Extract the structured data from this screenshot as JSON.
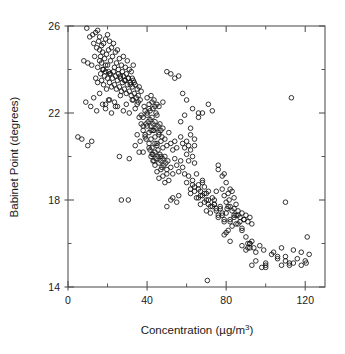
{
  "chart_data": {
    "type": "scatter",
    "title": "",
    "xlabel": "Concentration (µg/m3)",
    "xlabel_base": "Concentration (µg/m",
    "xlabel_sup": "3",
    "xlabel_close": ")",
    "ylabel": "Babinet Point (degrees)",
    "xlim": [
      0,
      130
    ],
    "ylim": [
      14,
      26
    ],
    "xticks": [
      0,
      20,
      40,
      60,
      80,
      100,
      120
    ],
    "xtick_labels": [
      "0",
      "",
      "40",
      "",
      "80",
      "",
      "120"
    ],
    "yticks": [
      14,
      16,
      18,
      20,
      22,
      24,
      26
    ],
    "ytick_labels": [
      "14",
      "",
      "18",
      "",
      "22",
      "",
      "26"
    ],
    "grid": false,
    "legend": false,
    "marker": "open-circle",
    "marker_size_px": 4.6,
    "marker_color": "#111111",
    "frame_color": "#555555",
    "n_points": 392,
    "x": [
      9.5,
      11.0,
      12.5,
      13.0,
      14.0,
      14.5,
      15.0,
      15.5,
      16.0,
      16.0,
      16.5,
      17.0,
      17.0,
      17.5,
      18.0,
      18.0,
      18.5,
      19.0,
      19.0,
      19.5,
      20.0,
      20.0,
      20.5,
      21.0,
      21.0,
      21.5,
      22.0,
      22.5,
      23.0,
      23.5,
      24.0,
      24.5,
      25.0,
      25.5,
      26.0,
      26.5,
      27.0,
      27.5,
      28.0,
      28.5,
      29.0,
      29.5,
      30.0,
      30.5,
      31.0,
      31.5,
      32.0,
      32.5,
      33.0,
      33.5,
      8.0,
      10.0,
      12.0,
      13.5,
      14.0,
      15.0,
      15.0,
      16.0,
      16.5,
      17.0,
      17.5,
      18.0,
      18.5,
      19.0,
      19.5,
      20.0,
      20.5,
      21.0,
      21.5,
      22.0,
      22.5,
      23.0,
      23.5,
      24.0,
      24.5,
      25.0,
      25.5,
      26.0,
      26.5,
      27.0,
      27.5,
      28.0,
      28.5,
      29.0,
      29.5,
      30.0,
      30.5,
      31.0,
      31.5,
      32.0,
      32.5,
      33.0,
      33.5,
      34.0,
      34.5,
      35.0,
      35.5,
      36.0,
      36.5,
      37.0,
      9.0,
      11.5,
      13.0,
      14.5,
      16.0,
      17.5,
      19.0,
      20.5,
      22.0,
      23.5,
      25.0,
      26.5,
      28.0,
      29.5,
      31.0,
      32.5,
      34.0,
      35.5,
      37.0,
      38.5,
      40.0,
      41.0,
      41.5,
      42.0,
      42.5,
      43.0,
      43.5,
      44.0,
      44.5,
      45.0,
      38.0,
      39.0,
      39.5,
      40.0,
      40.5,
      41.0,
      41.5,
      42.0,
      42.5,
      43.0,
      43.5,
      44.0,
      44.5,
      45.0,
      45.5,
      46.0,
      46.5,
      47.0,
      47.5,
      48.0,
      36.0,
      37.0,
      38.0,
      39.0,
      40.0,
      41.0,
      42.0,
      43.0,
      44.0,
      45.0,
      46.0,
      47.0,
      48.0,
      49.0,
      50.0,
      51.0,
      52.0,
      53.0,
      54.0,
      55.0,
      34.0,
      35.0,
      36.5,
      38.0,
      39.5,
      41.0,
      42.5,
      44.0,
      45.5,
      47.0,
      41.0,
      41.5,
      42.0,
      42.5,
      43.0,
      43.5,
      44.0,
      44.5,
      45.0,
      45.5,
      46.0,
      46.5,
      47.0,
      47.5,
      48.0,
      48.5,
      49.0,
      49.5,
      50.0,
      50.5,
      5.0,
      7.0,
      10.0,
      12.0,
      19.0,
      21.0,
      24.0,
      26.0,
      27.0,
      30.5,
      31.0,
      33.0,
      35.0,
      36.0,
      38.0,
      39.0,
      40.0,
      42.0,
      43.0,
      44.0,
      45.0,
      46.0,
      47.0,
      48.0,
      49.0,
      50.0,
      51.0,
      52.0,
      53.0,
      54.0,
      46.0,
      48.0,
      50.0,
      52.0,
      54.0,
      56.0,
      58.0,
      60.0,
      62.0,
      64.0,
      50.0,
      52.0,
      53.0,
      55.0,
      56.0,
      57.0,
      58.0,
      59.0,
      60.0,
      61.0,
      55.0,
      56.0,
      57.0,
      58.0,
      59.0,
      60.0,
      61.0,
      62.0,
      63.0,
      64.0,
      60.0,
      61.0,
      62.0,
      63.0,
      64.0,
      65.0,
      66.0,
      67.0,
      68.0,
      69.0,
      62.0,
      63.0,
      64.0,
      65.0,
      66.0,
      67.0,
      68.0,
      69.0,
      70.0,
      71.0,
      66.0,
      67.0,
      68.0,
      69.0,
      70.0,
      71.0,
      72.0,
      73.0,
      74.0,
      75.0,
      70.0,
      71.0,
      72.0,
      73.0,
      74.0,
      75.0,
      76.0,
      77.0,
      78.0,
      79.0,
      74.0,
      75.0,
      76.0,
      77.0,
      78.0,
      79.0,
      80.0,
      81.0,
      82.0,
      83.0,
      78.0,
      79.0,
      80.0,
      80.5,
      81.0,
      81.5,
      82.0,
      83.0,
      84.0,
      85.0,
      80.0,
      81.0,
      82.0,
      83.0,
      84.0,
      85.0,
      86.0,
      87.0,
      88.0,
      89.0,
      84.0,
      85.0,
      86.0,
      87.0,
      88.0,
      89.0,
      90.0,
      91.0,
      92.0,
      93.0,
      57.0,
      59.0,
      62.0,
      64.0,
      66.0,
      68.0,
      71.0,
      73.0,
      76.0,
      79.0,
      76.0,
      78.0,
      80.0,
      82.0,
      84.0,
      86.0,
      88.0,
      90.0,
      92.0,
      94.0,
      88.0,
      90.0,
      91.0,
      92.0,
      93.0,
      95.0,
      97.0,
      99.0,
      100.0,
      103.0,
      93.0,
      95.0,
      98.0,
      100.0,
      104.0,
      106.0,
      108.0,
      110.0,
      112.0,
      114.0,
      106.0,
      108.0,
      110.0,
      112.0,
      114.0,
      116.0,
      118.0,
      120.0,
      120.5,
      122.0,
      110.0,
      113.0,
      70.5,
      79.0,
      82.0,
      91.0,
      92.0,
      100.0,
      118.0,
      121.0,
      63.0,
      66.0
    ],
    "y": [
      25.9,
      25.5,
      25.6,
      25.2,
      25.7,
      25.0,
      25.8,
      25.3,
      24.9,
      25.5,
      24.6,
      25.1,
      24.3,
      24.8,
      25.2,
      24.0,
      24.5,
      25.4,
      23.9,
      24.7,
      25.6,
      24.2,
      24.9,
      25.3,
      23.8,
      24.4,
      25.0,
      24.6,
      25.2,
      24.1,
      24.8,
      24.3,
      24.9,
      24.0,
      24.5,
      23.7,
      24.2,
      23.9,
      24.6,
      23.5,
      24.1,
      23.8,
      24.4,
      23.6,
      24.0,
      23.3,
      23.9,
      23.6,
      24.2,
      23.4,
      24.4,
      24.3,
      24.2,
      24.6,
      23.6,
      24.1,
      23.4,
      24.4,
      23.8,
      23.5,
      24.0,
      23.3,
      23.7,
      24.2,
      23.1,
      23.6,
      23.9,
      23.4,
      23.8,
      23.2,
      23.6,
      23.9,
      23.3,
      23.7,
      23.1,
      23.5,
      23.8,
      23.2,
      23.6,
      23.0,
      23.4,
      23.7,
      23.1,
      23.5,
      22.9,
      23.3,
      23.6,
      23.0,
      23.4,
      22.8,
      23.2,
      23.5,
      22.9,
      23.3,
      22.7,
      23.1,
      22.8,
      23.2,
      22.6,
      23.0,
      22.5,
      22.3,
      22.7,
      22.1,
      22.9,
      22.4,
      22.2,
      22.6,
      22.0,
      22.5,
      22.3,
      22.8,
      22.1,
      22.4,
      22.0,
      22.6,
      22.2,
      22.5,
      21.9,
      22.3,
      22.7,
      22.4,
      22.1,
      22.8,
      22.5,
      22.2,
      22.6,
      22.3,
      22.0,
      22.4,
      21.8,
      22.1,
      21.5,
      21.9,
      21.6,
      22.2,
      21.7,
      21.4,
      21.8,
      21.5,
      21.2,
      21.6,
      21.3,
      21.9,
      21.4,
      21.1,
      21.5,
      21.2,
      20.9,
      21.3,
      21.8,
      21.5,
      21.2,
      20.9,
      21.4,
      21.1,
      20.8,
      21.2,
      20.9,
      20.6,
      21.0,
      20.7,
      20.4,
      20.8,
      20.5,
      21.1,
      20.6,
      20.3,
      20.7,
      20.4,
      20.5,
      21.0,
      20.7,
      20.2,
      20.8,
      20.4,
      20.1,
      20.6,
      20.3,
      20.0,
      20.6,
      20.3,
      20.0,
      20.4,
      20.1,
      19.8,
      20.2,
      19.9,
      20.5,
      20.0,
      19.7,
      20.1,
      19.8,
      19.5,
      19.9,
      19.6,
      20.0,
      19.7,
      19.4,
      19.8,
      20.9,
      20.8,
      20.5,
      20.7,
      22.4,
      22.6,
      22.3,
      20.0,
      18.0,
      18.0,
      19.9,
      22.6,
      22.4,
      20.2,
      21.4,
      21.0,
      22.0,
      21.2,
      19.8,
      19.6,
      19.3,
      19.0,
      19.4,
      19.1,
      18.8,
      19.2,
      18.9,
      19.5,
      19.2,
      19.9,
      22.3,
      22.5,
      23.9,
      23.8,
      23.6,
      23.7,
      22.9,
      22.6,
      21.0,
      20.8,
      17.7,
      18.0,
      18.1,
      17.9,
      18.2,
      20.9,
      20.6,
      20.4,
      20.7,
      20.5,
      19.6,
      19.3,
      19.8,
      19.5,
      19.2,
      20.1,
      19.8,
      20.3,
      20.0,
      19.7,
      18.8,
      19.1,
      18.5,
      18.9,
      18.6,
      19.2,
      18.7,
      18.4,
      18.9,
      18.6,
      18.3,
      18.7,
      18.4,
      18.1,
      18.5,
      18.2,
      18.8,
      18.3,
      18.0,
      18.4,
      18.1,
      17.8,
      18.2,
      17.9,
      18.3,
      18.0,
      17.7,
      18.1,
      17.8,
      18.4,
      17.5,
      17.8,
      17.4,
      17.7,
      18.0,
      17.6,
      17.3,
      17.7,
      17.4,
      17.1,
      17.8,
      17.5,
      17.2,
      17.6,
      17.3,
      17.0,
      17.4,
      17.7,
      17.1,
      17.5,
      18.5,
      18.2,
      17.9,
      17.6,
      18.3,
      18.0,
      17.7,
      18.4,
      18.1,
      17.8,
      16.5,
      16.6,
      17.0,
      16.8,
      17.2,
      16.9,
      17.3,
      17.0,
      16.7,
      17.1,
      17.6,
      17.3,
      17.5,
      17.2,
      17.4,
      17.1,
      17.3,
      17.0,
      17.2,
      16.9,
      21.6,
      21.9,
      21.3,
      20.5,
      21.8,
      22.0,
      22.4,
      22.1,
      19.6,
      19.2,
      19.4,
      19.1,
      18.8,
      18.5,
      17.3,
      16.9,
      16.6,
      16.3,
      16.0,
      15.8,
      15.9,
      15.7,
      16.0,
      15.8,
      16.1,
      15.6,
      15.9,
      15.7,
      15.1,
      15.5,
      15.0,
      15.2,
      14.9,
      15.0,
      15.6,
      15.4,
      15.8,
      15.2,
      15.0,
      15.1,
      15.3,
      15.0,
      15.4,
      15.1,
      15.7,
      15.3,
      15.6,
      15.2,
      15.1,
      15.5,
      17.9,
      22.7,
      14.3,
      16.4,
      16.1,
      15.8,
      16.0,
      14.9,
      15.0,
      16.3,
      22.2,
      22.0
    ]
  }
}
